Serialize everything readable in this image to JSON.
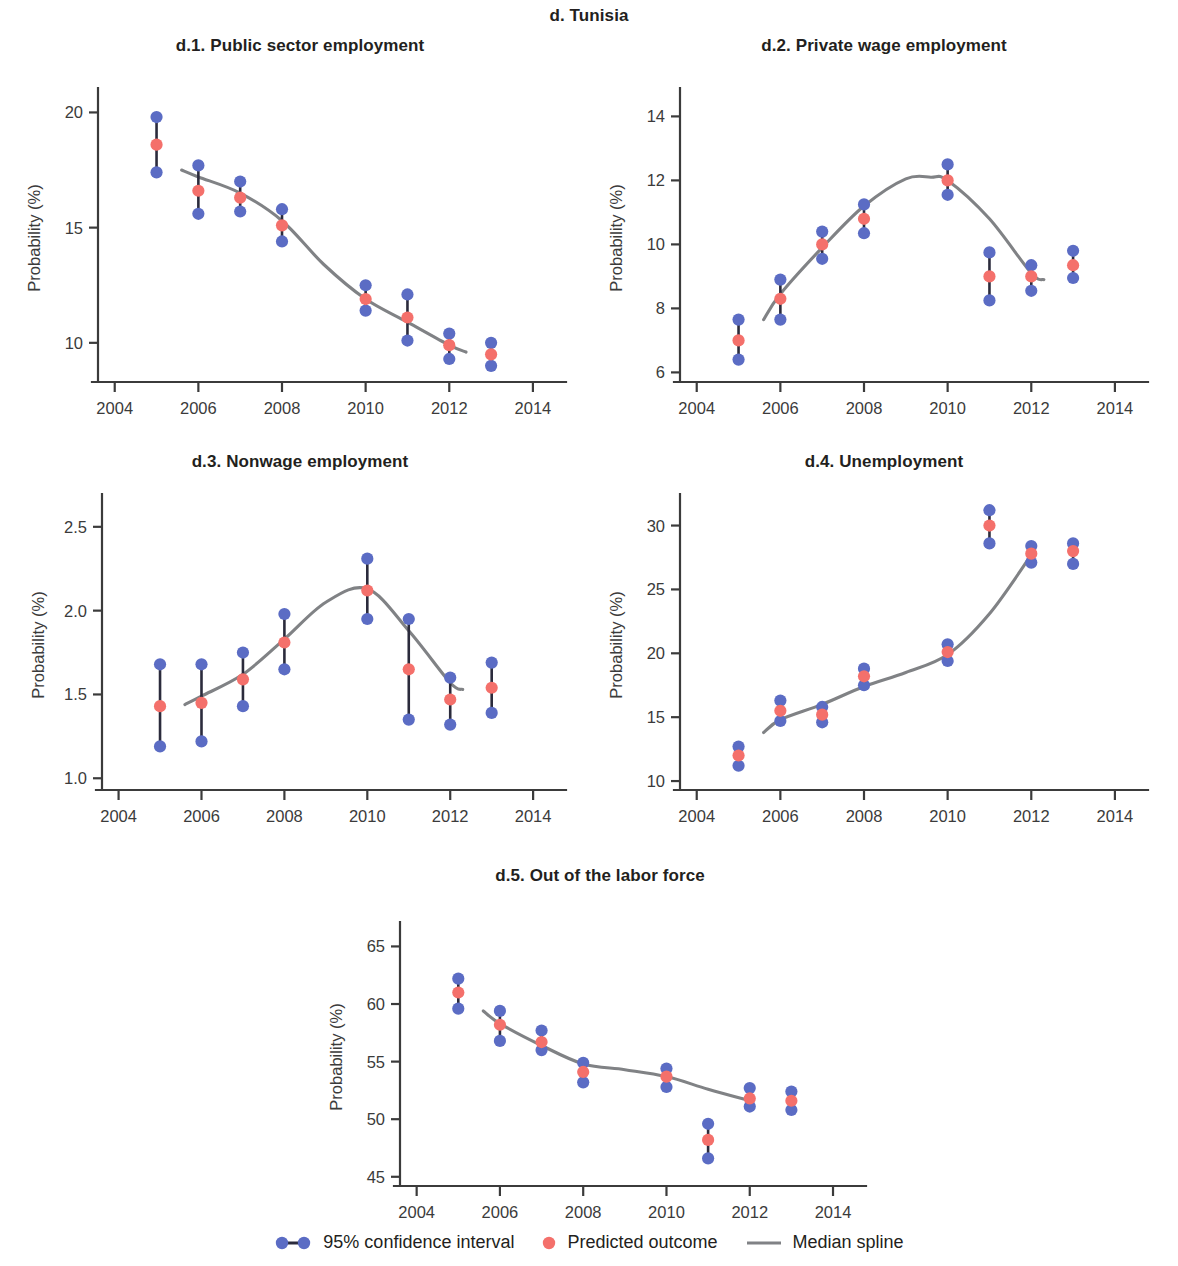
{
  "figure": {
    "title": "d. Tunisia",
    "axis_y_label": "Probability (%)",
    "x_ticks": [
      2004,
      2006,
      2008,
      2010,
      2012,
      2014
    ],
    "x_range": [
      2003.6,
      2014.6
    ],
    "colors": {
      "ci_blue": "#5b6cc4",
      "predicted_red": "#f4706b",
      "spline_gray": "#808285",
      "axis": "#3b3b3b",
      "text": "#231f20"
    }
  },
  "legend": {
    "items": [
      {
        "key": "ci",
        "label": "95% confidence interval",
        "marker": "dumbbell-marker"
      },
      {
        "key": "predicted",
        "label": "Predicted outcome",
        "marker": "dot-marker"
      },
      {
        "key": "spline",
        "label": "Median spline",
        "marker": "line-marker"
      }
    ]
  },
  "chart_data": [
    {
      "id": "d1",
      "type": "scatter",
      "title": "d.1. Public sector employment",
      "xlabel": "",
      "ylabel": "Probability (%)",
      "x": [
        2005,
        2006,
        2007,
        2008,
        2010,
        2011,
        2012,
        2013
      ],
      "predicted": [
        18.6,
        16.6,
        16.3,
        15.1,
        11.9,
        11.1,
        9.9,
        9.5
      ],
      "ci_low": [
        17.4,
        15.6,
        15.7,
        14.4,
        11.4,
        10.1,
        9.3,
        9.0
      ],
      "ci_high": [
        19.8,
        17.7,
        17.0,
        15.8,
        12.5,
        12.1,
        10.4,
        10.0
      ],
      "ylim": [
        8.3,
        20.8
      ],
      "y_ticks": [
        10,
        15,
        20
      ],
      "spline_x": [
        2005.6,
        2006,
        2007,
        2008,
        2009,
        2010,
        2011,
        2012,
        2012.4
      ],
      "spline_y": [
        17.5,
        17.2,
        16.5,
        15.3,
        13.4,
        11.9,
        10.9,
        9.9,
        9.6
      ],
      "grid": false,
      "legend_position": "figure-bottom"
    },
    {
      "id": "d2",
      "type": "scatter",
      "title": "d.2. Private wage employment",
      "xlabel": "",
      "ylabel": "Probability (%)",
      "x": [
        2005,
        2006,
        2007,
        2008,
        2010,
        2011,
        2012,
        2013
      ],
      "predicted": [
        7.0,
        8.3,
        10.0,
        10.8,
        12.0,
        9.0,
        9.0,
        9.35
      ],
      "ci_low": [
        6.4,
        7.65,
        9.55,
        10.35,
        11.55,
        8.25,
        8.55,
        8.95
      ],
      "ci_high": [
        7.65,
        8.9,
        10.4,
        11.25,
        12.5,
        9.75,
        9.35,
        9.8
      ],
      "ylim": [
        5.7,
        14.7
      ],
      "y_ticks": [
        6,
        8,
        10,
        12,
        14
      ],
      "spline_x": [
        2005.6,
        2006,
        2007,
        2008,
        2009,
        2009.6,
        2010,
        2011,
        2012,
        2012.3
      ],
      "spline_y": [
        7.65,
        8.45,
        9.9,
        11.2,
        12.05,
        12.1,
        12.0,
        10.8,
        9.1,
        8.9
      ],
      "grid": false,
      "legend_position": "figure-bottom"
    },
    {
      "id": "d3",
      "type": "scatter",
      "title": "d.3. Nonwage employment",
      "xlabel": "",
      "ylabel": "Probability (%)",
      "x": [
        2005,
        2006,
        2007,
        2008,
        2010,
        2011,
        2012,
        2013
      ],
      "predicted": [
        1.43,
        1.45,
        1.59,
        1.81,
        2.12,
        1.65,
        1.47,
        1.54
      ],
      "ci_low": [
        1.19,
        1.22,
        1.43,
        1.65,
        1.95,
        1.35,
        1.32,
        1.39
      ],
      "ci_high": [
        1.68,
        1.68,
        1.75,
        1.98,
        2.31,
        1.95,
        1.6,
        1.69
      ],
      "ylim": [
        0.93,
        2.66
      ],
      "y_ticks": [
        1.0,
        1.5,
        2.0,
        2.5
      ],
      "spline_x": [
        2005.6,
        2006,
        2007,
        2008,
        2009,
        2010,
        2011,
        2012,
        2012.3
      ],
      "spline_y": [
        1.44,
        1.49,
        1.62,
        1.83,
        2.05,
        2.13,
        1.88,
        1.57,
        1.53
      ],
      "grid": false,
      "legend_position": "figure-bottom"
    },
    {
      "id": "d4",
      "type": "scatter",
      "title": "d.4. Unemployment",
      "xlabel": "",
      "ylabel": "Probability (%)",
      "x": [
        2005,
        2006,
        2007,
        2008,
        2010,
        2011,
        2012,
        2013
      ],
      "predicted": [
        12.0,
        15.5,
        15.2,
        18.2,
        20.1,
        30.0,
        27.8,
        28.0
      ],
      "ci_low": [
        11.2,
        14.7,
        14.6,
        17.5,
        19.4,
        28.6,
        27.1,
        27.0
      ],
      "ci_high": [
        12.7,
        16.3,
        15.8,
        18.8,
        20.7,
        31.2,
        28.4,
        28.6
      ],
      "ylim": [
        9.3,
        32.0
      ],
      "y_ticks": [
        10,
        15,
        20,
        25,
        30
      ],
      "spline_x": [
        2005.6,
        2006,
        2007,
        2008,
        2009,
        2010,
        2011,
        2012
      ],
      "spline_y": [
        13.8,
        14.8,
        16.0,
        17.4,
        18.5,
        19.9,
        23.1,
        27.7
      ],
      "grid": false,
      "legend_position": "figure-bottom"
    },
    {
      "id": "d5",
      "type": "scatter",
      "title": "d.5. Out of the labor force",
      "xlabel": "",
      "ylabel": "Probability (%)",
      "x": [
        2005,
        2006,
        2007,
        2008,
        2010,
        2011,
        2012,
        2013
      ],
      "predicted": [
        61.0,
        58.2,
        56.7,
        54.1,
        53.7,
        48.2,
        51.8,
        51.6
      ],
      "ci_low": [
        59.6,
        56.8,
        56.0,
        53.2,
        52.8,
        46.6,
        51.1,
        50.8
      ],
      "ci_high": [
        62.2,
        59.4,
        57.7,
        54.9,
        54.4,
        49.6,
        52.7,
        52.4
      ],
      "ylim": [
        44.2,
        66.6
      ],
      "y_ticks": [
        45,
        50,
        55,
        60,
        65
      ],
      "spline_x": [
        2005.6,
        2006,
        2007,
        2008,
        2009,
        2010,
        2011,
        2012
      ],
      "spline_y": [
        59.4,
        58.3,
        56.4,
        54.8,
        54.3,
        53.7,
        52.6,
        51.6
      ],
      "grid": false,
      "legend_position": "figure-bottom"
    }
  ]
}
